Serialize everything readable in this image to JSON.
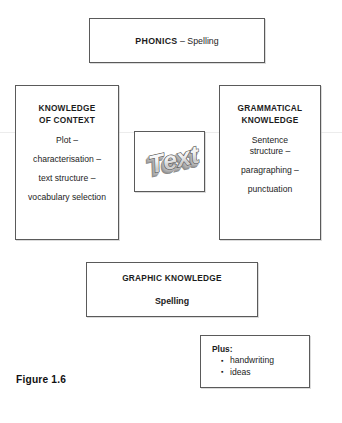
{
  "figure": {
    "caption": "Figure 1.6"
  },
  "phonics_box": {
    "title": "PHONICS",
    "separator": " – ",
    "subtitle": "Spelling"
  },
  "context_box": {
    "title_line1": "KNOWLEDGE",
    "title_line2": "OF CONTEXT",
    "items": [
      "Plot –",
      "characterisation –",
      "text structure –",
      "vocabulary selection"
    ]
  },
  "text_box": {
    "wordart_label": "Text"
  },
  "grammar_box": {
    "title_line1": "GRAMMATICAL",
    "title_line2": "KNOWLEDGE",
    "items": [
      "Sentence",
      "structure –",
      "paragraphing –",
      "punctuation"
    ]
  },
  "graphic_box": {
    "title": "GRAPHIC KNOWLEDGE",
    "subtitle": "Spelling"
  },
  "plus_box": {
    "title": "Plus:",
    "items": [
      "handwriting",
      "ideas"
    ]
  },
  "colors": {
    "border": "#5a5a5a",
    "text": "#1c1c1c",
    "background": "#ffffff",
    "wordart_outline": "#4a4a4a",
    "wordart_fill_light": "#fbfbfb",
    "wordart_fill_mid": "#d2d2d2",
    "wordart_extrude": "#8e8e8e"
  }
}
